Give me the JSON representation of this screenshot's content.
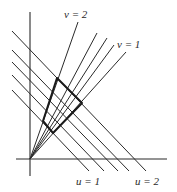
{
  "figure": {
    "type": "coordinate-transformation-grid",
    "origin": [
      30,
      159
    ],
    "axes": {
      "vertical": {
        "x": 30,
        "y1": 12,
        "y2": 176
      },
      "horizontal": {
        "y": 159,
        "x1": 16,
        "x2": 167
      }
    },
    "u_lines": [
      {
        "x1": 12,
        "y1": 31,
        "x2": 146,
        "y2": 171
      },
      {
        "x1": 12,
        "y1": 50,
        "x2": 129,
        "y2": 171
      },
      {
        "x1": 12,
        "y1": 62,
        "x2": 118,
        "y2": 171
      },
      {
        "x1": 12,
        "y1": 75,
        "x2": 104,
        "y2": 171
      },
      {
        "x1": 12,
        "y1": 90,
        "x2": 89,
        "y2": 171
      }
    ],
    "v_lines": [
      {
        "x2": 78,
        "y2": 22
      },
      {
        "x2": 97,
        "y2": 33
      },
      {
        "x2": 107,
        "y2": 38
      },
      {
        "x2": 114,
        "y2": 45
      },
      {
        "x2": 126,
        "y2": 52
      }
    ],
    "region": {
      "points": "57,78 82,103 53,133 43,121"
    },
    "labels": {
      "v2": {
        "text": "v = 2",
        "x": 64,
        "y": 18
      },
      "v1": {
        "text": "v = 1",
        "x": 117,
        "y": 48
      },
      "u1": {
        "text": "u = 1",
        "x": 76,
        "y": 185
      },
      "u2": {
        "text": "u = 2",
        "x": 135,
        "y": 185
      }
    },
    "colors": {
      "ink": "#2a2a2a",
      "background": "#ffffff"
    }
  }
}
